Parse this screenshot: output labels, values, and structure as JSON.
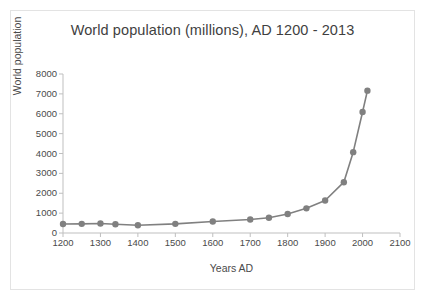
{
  "chart_data": {
    "type": "line",
    "title": "World population (millions), AD 1200 - 2013",
    "xlabel": "Years AD",
    "ylabel": "World population",
    "xlim": [
      1200,
      2100
    ],
    "ylim": [
      0,
      8000
    ],
    "xticks": [
      1200,
      1300,
      1400,
      1500,
      1600,
      1700,
      1800,
      1900,
      2000,
      2100
    ],
    "yticks": [
      0,
      1000,
      2000,
      3000,
      4000,
      5000,
      6000,
      7000,
      8000
    ],
    "xtick_labels": [
      "1200",
      "1300",
      "1400",
      "1500",
      "1600",
      "1700",
      "1800",
      "1900",
      "2000",
      "2100"
    ],
    "ytick_labels": [
      "0",
      "1000",
      "2000",
      "3000",
      "4000",
      "5000",
      "6000",
      "7000",
      "8000"
    ],
    "grid": false,
    "legend": "none",
    "series": [
      {
        "name": "World population",
        "color": "#808080",
        "marker": "circle",
        "x": [
          1200,
          1250,
          1300,
          1340,
          1400,
          1500,
          1600,
          1700,
          1750,
          1800,
          1850,
          1900,
          1950,
          1975,
          2000,
          2013
        ],
        "values": [
          450,
          460,
          480,
          443,
          390,
          460,
          579,
          679,
          770,
          954,
          1241,
          1634,
          2557,
          4068,
          6088,
          7162
        ]
      }
    ]
  },
  "axes": {
    "axis_color": "#bfbfbf",
    "text_color": "#4a4a4a"
  }
}
